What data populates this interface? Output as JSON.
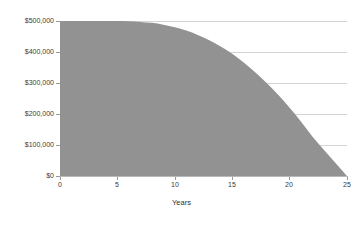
{
  "chart_data": {
    "type": "area",
    "title": "",
    "subtitle": "",
    "xlabel": "Years",
    "ylabel": "",
    "xlim": [
      0,
      25
    ],
    "ylim": [
      0,
      500000
    ],
    "grid": true,
    "legend_position": "none",
    "series_color": "#929292",
    "gridline_color": "#d4d4d4",
    "axis_color": "#b8b8b8",
    "x_tick_labels": [
      "0",
      "5",
      "10",
      "15",
      "20",
      "25"
    ],
    "x_ticks": [
      0,
      5,
      10,
      15,
      20,
      25
    ],
    "y_tick_labels": [
      "$500,000",
      "$400,000",
      "$300,000",
      "$200,000",
      "$100,000",
      "$0"
    ],
    "y_ticks": [
      500000,
      400000,
      300000,
      200000,
      100000,
      0
    ],
    "series": [
      {
        "name": "Balance",
        "x": [
          0,
          1,
          2,
          3,
          4,
          5,
          6,
          7,
          8,
          9,
          10,
          11,
          12,
          13,
          14,
          15,
          16,
          17,
          18,
          19,
          20,
          21,
          22,
          23,
          24,
          25
        ],
        "values": [
          500000,
          500000,
          500000,
          500000,
          500000,
          500000,
          499000,
          497000,
          494000,
          488000,
          480000,
          469000,
          455000,
          438000,
          418000,
          394000,
          366000,
          335000,
          300000,
          262000,
          220000,
          175000,
          127000,
          84000,
          42000,
          0
        ]
      }
    ],
    "annotations": []
  }
}
